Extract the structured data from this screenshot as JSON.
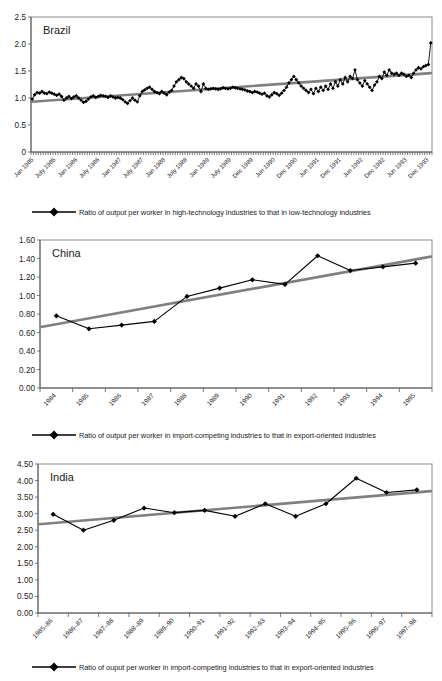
{
  "document": {
    "kind": "three-panel-line-chart-figure"
  },
  "panels": [
    {
      "id": "brazil",
      "title": "Brazil",
      "legend": "Ratio of output per worker in high-technology industries to that in low-technology industries",
      "legend_marker": "diamond-line-marker"
    },
    {
      "id": "china",
      "title": "China",
      "legend": "Ratio of output per worker in import-competing industries to that in export-oriented industries",
      "legend_marker": "diamond-line-marker"
    },
    {
      "id": "india",
      "title": "India",
      "legend": "Ratio of ouput per worker in import-competing industries to that in export-oriented industries",
      "legend_marker": "diamond-line-marker"
    }
  ],
  "chart_data": [
    {
      "type": "line",
      "title": "Brazil",
      "xlabel": "",
      "ylabel": "",
      "ylim": [
        0,
        2.5
      ],
      "yticks": [
        "0",
        "0.5",
        "1.0",
        "1.5",
        "2.0",
        "2.5"
      ],
      "ytickvals": [
        0,
        0.5,
        1.0,
        1.5,
        2.0,
        2.5
      ],
      "grid": false,
      "legend_position": "below",
      "xtick_labels": [
        "Jan 1985",
        "July 1985",
        "Jan 1986",
        "July 1986",
        "Jan 1987",
        "July 1987",
        "Jan 1988",
        "July 1988",
        "Jan 1989",
        "July 1989",
        "Dec 1989",
        "Jun 1990",
        "Dec 1990",
        "Jun 1991",
        "Dec 1991",
        "Jun 1992",
        "Dec 1992",
        "Jun 1993",
        "Dec 1993"
      ],
      "series": [
        {
          "name": "Ratio of output per worker in high-technology industries to that in low-technology industries",
          "values": [
            0.98,
            1.06,
            1.1,
            1.09,
            1.12,
            1.09,
            1.08,
            1.11,
            1.09,
            1.07,
            1.05,
            1.07,
            1.03,
            0.96,
            1.0,
            1.03,
            0.99,
            1.02,
            1.04,
            1.0,
            0.96,
            0.92,
            0.94,
            0.98,
            1.02,
            1.04,
            1.01,
            1.03,
            1.05,
            1.04,
            1.03,
            1.01,
            1.04,
            1.02,
            1.0,
            1.01,
            1.0,
            0.97,
            0.93,
            0.9,
            0.95,
            1.0,
            0.96,
            0.93,
            1.04,
            1.12,
            1.15,
            1.18,
            1.2,
            1.16,
            1.12,
            1.1,
            1.08,
            1.12,
            1.09,
            1.06,
            1.11,
            1.14,
            1.22,
            1.3,
            1.34,
            1.38,
            1.36,
            1.3,
            1.26,
            1.22,
            1.18,
            1.26,
            1.22,
            1.12,
            1.26,
            1.18,
            1.16,
            1.17,
            1.18,
            1.17,
            1.16,
            1.17,
            1.19,
            1.18,
            1.17,
            1.18,
            1.2,
            1.19,
            1.18,
            1.17,
            1.16,
            1.15,
            1.13,
            1.12,
            1.1,
            1.12,
            1.11,
            1.09,
            1.07,
            1.09,
            1.04,
            1.02,
            1.06,
            1.1,
            1.08,
            1.05,
            1.09,
            1.14,
            1.2,
            1.28,
            1.34,
            1.4,
            1.34,
            1.28,
            1.22,
            1.18,
            1.14,
            1.1,
            1.16,
            1.08,
            1.18,
            1.12,
            1.2,
            1.14,
            1.22,
            1.16,
            1.26,
            1.18,
            1.3,
            1.22,
            1.34,
            1.26,
            1.38,
            1.3,
            1.4,
            1.36,
            1.52,
            1.34,
            1.28,
            1.22,
            1.32,
            1.26,
            1.2,
            1.14,
            1.24,
            1.3,
            1.4,
            1.36,
            1.48,
            1.42,
            1.52,
            1.46,
            1.44,
            1.46,
            1.42,
            1.46,
            1.44,
            1.4,
            1.42,
            1.38,
            1.46,
            1.52,
            1.56,
            1.54,
            1.58,
            1.6,
            1.62,
            2.02
          ]
        }
      ],
      "trendline": {
        "y_start": 0.93,
        "y_end": 1.46
      }
    },
    {
      "type": "line",
      "title": "China",
      "xlabel": "",
      "ylabel": "",
      "ylim": [
        0.0,
        1.6
      ],
      "yticks": [
        "0.00",
        "0.20",
        "0.40",
        "0.60",
        "0.80",
        "1.00",
        "1.20",
        "1.40",
        "1.60"
      ],
      "ytickvals": [
        0.0,
        0.2,
        0.4,
        0.6,
        0.8,
        1.0,
        1.2,
        1.4,
        1.6
      ],
      "grid": false,
      "legend_position": "below",
      "categories": [
        "1984",
        "1985",
        "1986",
        "1987",
        "1988",
        "1989",
        "1990",
        "1991",
        "1992",
        "1993",
        "1994",
        "1995"
      ],
      "series": [
        {
          "name": "Ratio of output per worker in import-competing industries to that in export-oriented industries",
          "values": [
            0.78,
            0.64,
            0.68,
            0.72,
            0.99,
            1.08,
            1.17,
            1.12,
            1.43,
            1.27,
            1.31,
            1.35
          ]
        }
      ],
      "trendline": {
        "y_start": 0.66,
        "y_end": 1.42
      }
    },
    {
      "type": "line",
      "title": "India",
      "xlabel": "",
      "ylabel": "",
      "ylim": [
        0.0,
        4.5
      ],
      "yticks": [
        "0.00",
        "0.50",
        "1.00",
        "1.50",
        "2.00",
        "2.50",
        "3.00",
        "3.50",
        "4.00",
        "4.50"
      ],
      "ytickvals": [
        0.0,
        0.5,
        1.0,
        1.5,
        2.0,
        2.5,
        3.0,
        3.5,
        4.0,
        4.5
      ],
      "grid": false,
      "legend_position": "below",
      "categories": [
        "1985–86",
        "1986–87",
        "1987–88",
        "1988–89",
        "1989–90",
        "1990–91",
        "1991–92",
        "1992–93",
        "1993–94",
        "1994–95",
        "1995–96",
        "1996–97",
        "1997–98"
      ],
      "series": [
        {
          "name": "Ratio of ouput per worker in import-competing industries to that in export-oriented industries",
          "values": [
            2.98,
            2.5,
            2.8,
            3.17,
            3.03,
            3.1,
            2.92,
            3.3,
            2.92,
            3.3,
            4.07,
            3.64,
            3.72
          ]
        }
      ],
      "trendline": {
        "y_start": 2.68,
        "y_end": 3.68
      }
    }
  ],
  "colors": {
    "data_line": "#000000",
    "trend_line": "#808080",
    "axis": "#5a5a5a",
    "frame": "#8a8a8a",
    "text": "#1a1a1a",
    "background": "#ffffff"
  }
}
